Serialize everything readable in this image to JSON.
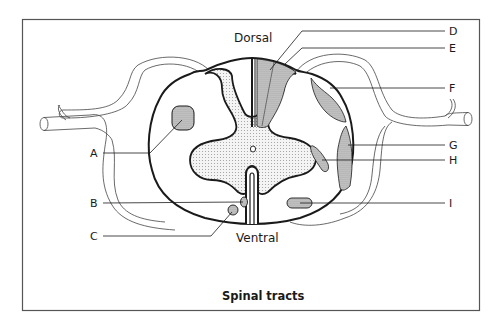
{
  "figure": {
    "caption": "Spinal tracts",
    "orientation": {
      "top": "Dorsal",
      "bottom": "Ventral"
    },
    "colors": {
      "outline": "#1a1a1a",
      "frame": "#555555",
      "grey_matter_bg": "#f3f3f3",
      "grey_matter_dot": "#9a9a9a",
      "tract_fill": "#c4c4c4",
      "tract_dot": "#7a7a7a",
      "background": "#ffffff"
    },
    "labels": [
      {
        "id": "A",
        "text": "A",
        "side": "left"
      },
      {
        "id": "B",
        "text": "B",
        "side": "left"
      },
      {
        "id": "C",
        "text": "C",
        "side": "left"
      },
      {
        "id": "D",
        "text": "D",
        "side": "right"
      },
      {
        "id": "E",
        "text": "E",
        "side": "right"
      },
      {
        "id": "F",
        "text": "F",
        "side": "right"
      },
      {
        "id": "G",
        "text": "G",
        "side": "right"
      },
      {
        "id": "H",
        "text": "H",
        "side": "right"
      },
      {
        "id": "I",
        "text": "I",
        "side": "right"
      }
    ]
  }
}
